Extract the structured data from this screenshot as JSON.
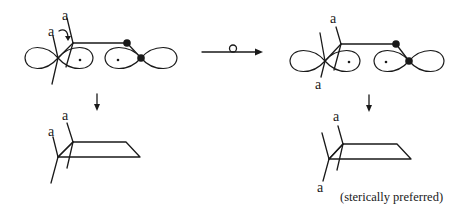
{
  "diagram": {
    "type": "reaction-scheme",
    "labels": {
      "substituent": "a",
      "reaction_arrow_symbol": "o",
      "note": "(sterically preferred)"
    },
    "panels": [
      {
        "id": "top-left",
        "content": "p-orbital pair with two axial substituents a, curved rotation arrow"
      },
      {
        "id": "top-right",
        "content": "p-orbital pair with substituents a on opposite faces"
      },
      {
        "id": "bottom-left",
        "content": "ring product with both a substituents up"
      },
      {
        "id": "bottom-right",
        "content": "ring product with a up and a down",
        "caption": "(sterically preferred)"
      }
    ],
    "arrows": [
      {
        "from": "top-left",
        "to": "top-right",
        "label": "o"
      },
      {
        "from": "top-left",
        "to": "bottom-left"
      },
      {
        "from": "top-right",
        "to": "bottom-right"
      }
    ]
  }
}
